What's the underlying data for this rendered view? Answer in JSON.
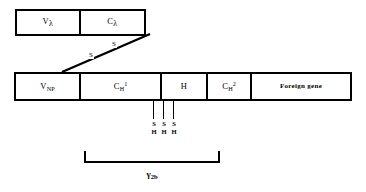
{
  "figure": {
    "type": "schematic-gene-map"
  },
  "light_chain": {
    "name": "light-chain-bar",
    "segments": [
      {
        "id": "v-lambda",
        "base": "V",
        "sub": "λ",
        "sup": "",
        "full_label": "Vλ"
      },
      {
        "id": "c-lambda",
        "base": "C",
        "sub": "λ",
        "sup": "",
        "full_label": "Cλ"
      }
    ]
  },
  "disulfide": {
    "name": "disulfide-bond",
    "letters": [
      "S",
      "S"
    ],
    "label": "S-S"
  },
  "heavy_chain": {
    "name": "heavy-chain-bar",
    "segments": [
      {
        "id": "v-np",
        "base": "V",
        "sub": "NP",
        "sup": "",
        "full_label": "VNP"
      },
      {
        "id": "ch1",
        "base": "C",
        "sub": "H",
        "sup": "1",
        "full_label": "CH1"
      },
      {
        "id": "hinge",
        "base": "H",
        "sub": "",
        "sup": "",
        "full_label": "H"
      },
      {
        "id": "ch2",
        "base": "C",
        "sub": "H",
        "sup": "2",
        "full_label": "CH2"
      },
      {
        "id": "foreign-gene",
        "base": "Foreign  gene",
        "sub": "",
        "sup": "",
        "full_label": "Foreign gene"
      }
    ]
  },
  "sulfhydryl_groups": {
    "name": "sh-groups",
    "count": 3,
    "items": [
      {
        "top": "S",
        "bottom": "H"
      },
      {
        "top": "S",
        "bottom": "H"
      },
      {
        "top": "S",
        "bottom": "H"
      }
    ]
  },
  "region_bracket": {
    "name": "gamma-2b-bracket",
    "base": "γ",
    "sub": "2b",
    "full_label": "γ2b"
  },
  "colors": {
    "stroke": "#000000",
    "background": "#ffffff"
  }
}
